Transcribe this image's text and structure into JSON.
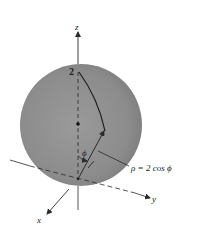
{
  "figure": {
    "type": "3d-sphere-spherical-coordinates",
    "colors": {
      "sphere_fill": "#8f8f8f",
      "sphere_fill_light": "#a6a6a6",
      "sphere_fill_dark": "#7a7a7a",
      "line": "#2a2a2a",
      "background": "#ffffff"
    },
    "labels": {
      "z_axis": "z",
      "x_axis": "x",
      "y_axis": "y",
      "top_value": "2",
      "angle": "ϕ",
      "equation": "ρ = 2 cos ϕ"
    }
  }
}
